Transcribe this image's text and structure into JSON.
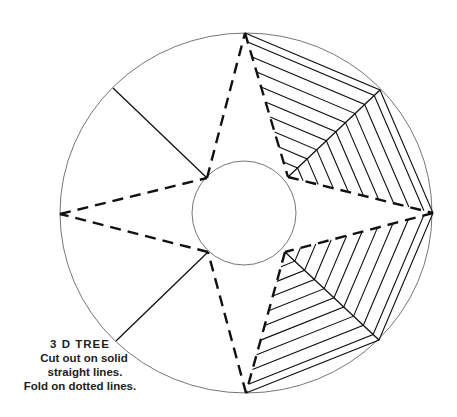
{
  "diagram": {
    "instructions": {
      "title": "3 D  TREE",
      "lines": [
        "Cut out on solid",
        "straight lines.",
        "Fold on dotted lines."
      ]
    },
    "legend": {
      "solid_line": "cut",
      "dotted_line": "fold"
    },
    "colors": {
      "line": "#111111",
      "circle": "#777777",
      "background": "#ffffff"
    },
    "outer_circle": {
      "cx": 246,
      "cy": 213,
      "rx": 186,
      "ry": 180
    },
    "inner_circle": {
      "cx": 244,
      "cy": 213,
      "r": 52
    },
    "star": {
      "outer_points": {
        "top": [
          245,
          33
        ],
        "right": [
          433,
          213
        ],
        "bottom": [
          246,
          393
        ],
        "left": [
          60,
          214
        ]
      },
      "inner_points": {
        "upper_left": [
          207,
          178
        ],
        "upper_right": [
          288,
          177
        ],
        "lower_right": [
          285,
          252
        ],
        "lower_left": [
          208,
          252
        ]
      }
    },
    "cut_lines": [
      {
        "name": "upper-left",
        "from": [
          207,
          178
        ],
        "to": [
          113,
          88
        ]
      },
      {
        "name": "upper-right",
        "from": [
          288,
          177
        ],
        "to": [
          380,
          90
        ]
      },
      {
        "name": "lower-right",
        "from": [
          285,
          252
        ],
        "to": [
          379,
          340
        ]
      },
      {
        "name": "lower-left",
        "from": [
          208,
          252
        ],
        "to": [
          116,
          341
        ]
      }
    ],
    "hatched_sections": [
      {
        "name": "upper-right",
        "chevron_count": 9
      },
      {
        "name": "lower-right",
        "chevron_count": 9
      }
    ]
  }
}
